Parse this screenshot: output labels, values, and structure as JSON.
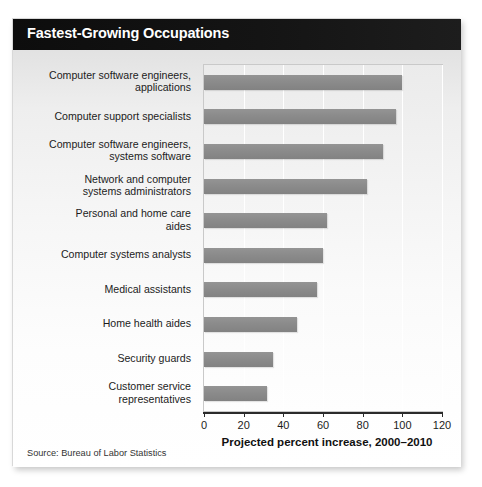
{
  "card": {
    "title": "Fastest-Growing Occupations",
    "source": "Source: Bureau of Labor Statistics"
  },
  "colors": {
    "title_bar_bg": "#0d0d0d",
    "title_text": "#ffffff",
    "bar_fill": "#8b8b8b",
    "plot_bg": "#f4f4f4",
    "gridline": "#ffffff",
    "axis": "#2a2a2a",
    "label_text": "#1c1c1c",
    "card_bg": "#ffffff"
  },
  "chart_data": {
    "type": "bar",
    "orientation": "horizontal",
    "title": "Fastest-Growing Occupations",
    "subtitle": "",
    "xlabel": "Projected percent increase, 2000–2010",
    "ylabel": "",
    "xlim": [
      0,
      120
    ],
    "xticks": [
      0,
      20,
      40,
      60,
      80,
      100,
      120
    ],
    "xtick_labels": [
      "0",
      "20",
      "40",
      "60",
      "80",
      "100",
      "120"
    ],
    "grid": true,
    "grid_axis": "x",
    "legend": false,
    "legend_position": "none",
    "categories": [
      "Computer software engineers,\napplications",
      "Computer support specialists",
      "Computer software engineers,\nsystems software",
      "Network and computer\nsystems administrators",
      "Personal and home care\naides",
      "Computer systems analysts",
      "Medical assistants",
      "Home health aides",
      "Security guards",
      "Customer service\nrepresentatives"
    ],
    "values": [
      100,
      97,
      90,
      82,
      62,
      60,
      57,
      47,
      35,
      32
    ],
    "units": "percent",
    "annotations": [
      "Source: Bureau of Labor Statistics"
    ]
  }
}
